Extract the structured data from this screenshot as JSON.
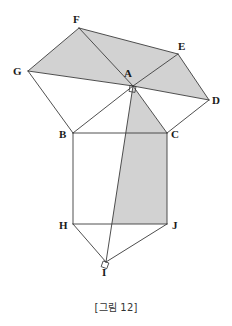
{
  "figure": {
    "caption": "[그림 12]",
    "width": 232,
    "height": 326,
    "background_color": "#ffffff",
    "stroke_color": "#3c3c3c",
    "shaded_fill_color": "#d2d2d2",
    "unshaded_fill_color": "#ffffff",
    "label_color": "#1a1a1a",
    "stroke_width": 0.9
  },
  "points": {
    "A": {
      "label": "A",
      "x": 133,
      "y": 86,
      "label_x": 124,
      "label_y": 68
    },
    "B": {
      "label": "B",
      "x": 73,
      "y": 133,
      "label_x": 59,
      "label_y": 129
    },
    "C": {
      "label": "C",
      "x": 167,
      "y": 133,
      "label_x": 171,
      "label_y": 129
    },
    "D": {
      "label": "D",
      "x": 209,
      "y": 100,
      "label_x": 212,
      "label_y": 95
    },
    "E": {
      "label": "E",
      "x": 178,
      "y": 54,
      "label_x": 178,
      "label_y": 41
    },
    "F": {
      "label": "F",
      "x": 79,
      "y": 28,
      "label_x": 73,
      "label_y": 14
    },
    "G": {
      "label": "G",
      "x": 28,
      "y": 71,
      "label_x": 13,
      "label_y": 66
    },
    "H": {
      "label": "H",
      "x": 73,
      "y": 224,
      "label_x": 59,
      "label_y": 220
    },
    "I": {
      "label": "I",
      "x": 106,
      "y": 262,
      "label_x": 102,
      "label_y": 267
    },
    "J": {
      "label": "J",
      "x": 167,
      "y": 224,
      "label_x": 172,
      "label_y": 220
    }
  },
  "shaded_regions": [
    {
      "name": "triangle-G-F-A",
      "vertices": "G,F,A"
    },
    {
      "name": "triangle-F-A-E",
      "vertices": "F,A,E"
    },
    {
      "name": "triangle-A-E-D",
      "vertices": "A,E,D"
    },
    {
      "name": "quad-A-C-J-I",
      "vertices": "A,C,J,I"
    }
  ],
  "unshaded_regions": [
    {
      "name": "triangle-G-B-A",
      "vertices": "G,B,A"
    },
    {
      "name": "triangle-A-C-D",
      "vertices": "A,C,D"
    },
    {
      "name": "square-B-C-J-H",
      "vertices": "B,C,J,H"
    },
    {
      "name": "triangle-H-I-J",
      "vertices": "H,I,J"
    }
  ],
  "segments": [
    {
      "name": "segment-G-F",
      "from": "G",
      "to": "F"
    },
    {
      "name": "segment-F-E",
      "from": "F",
      "to": "E"
    },
    {
      "name": "segment-E-D",
      "from": "E",
      "to": "D"
    },
    {
      "name": "segment-G-A",
      "from": "G",
      "to": "A"
    },
    {
      "name": "segment-F-A",
      "from": "F",
      "to": "A"
    },
    {
      "name": "segment-E-A",
      "from": "E",
      "to": "A"
    },
    {
      "name": "segment-A-D",
      "from": "A",
      "to": "D"
    },
    {
      "name": "segment-G-B",
      "from": "G",
      "to": "B"
    },
    {
      "name": "segment-B-A",
      "from": "B",
      "to": "A"
    },
    {
      "name": "segment-A-C",
      "from": "A",
      "to": "C"
    },
    {
      "name": "segment-C-D",
      "from": "C",
      "to": "D"
    },
    {
      "name": "segment-B-C",
      "from": "B",
      "to": "C"
    },
    {
      "name": "segment-B-H",
      "from": "B",
      "to": "H"
    },
    {
      "name": "segment-C-J",
      "from": "C",
      "to": "J"
    },
    {
      "name": "segment-H-J",
      "from": "H",
      "to": "J"
    },
    {
      "name": "segment-H-I",
      "from": "H",
      "to": "I"
    },
    {
      "name": "segment-I-J",
      "from": "I",
      "to": "J"
    },
    {
      "name": "segment-A-I",
      "from": "A",
      "to": "I"
    }
  ],
  "right_angle_markers": [
    {
      "name": "right-angle-at-A",
      "at": "A",
      "size": 6,
      "rotation": 10
    },
    {
      "name": "right-angle-at-I",
      "at": "I",
      "size": 6,
      "rotation": 20
    }
  ]
}
